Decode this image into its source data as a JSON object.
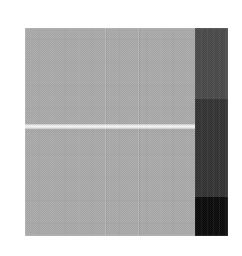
{
  "canvas": {
    "width": 242,
    "height": 256,
    "background": "#ffffff",
    "description": "Grayscale image panel with large flat gray field, one light horizontal stripe, and a right-hand vertical column of three darker tonal bands"
  },
  "image_block": {
    "label": "grayscale panel",
    "x": 25,
    "y": 28,
    "width": 203,
    "height": 208,
    "base_color": "#ababab"
  },
  "regions": {
    "gray_field": {
      "label": "flat gray field",
      "x": 0,
      "y": 0,
      "width": 170,
      "height": 208,
      "color": "#ababab",
      "texture": "fine dither noise with faint vertical and horizontal seams"
    },
    "light_stripe": {
      "label": "light horizontal stripe",
      "x": 0,
      "y": 96,
      "width": 170,
      "height": 5,
      "color": "#dcdcdc"
    },
    "seams": [
      {
        "label": "vertical seam light",
        "x": 80,
        "color": "#bdbdbd"
      },
      {
        "label": "vertical seam dark",
        "x": 81,
        "color": "#a2a2a2"
      },
      {
        "label": "vertical seam light",
        "x": 113,
        "color": "#b8b8b8"
      },
      {
        "label": "vertical seam dark",
        "x": 114,
        "color": "#a4a4a4"
      }
    ],
    "dark_column": {
      "label": "right tonal column",
      "x": 170,
      "y": 0,
      "width": 33,
      "height": 208,
      "bands": [
        {
          "label": "upper dark gray band",
          "y": 0,
          "height": 71,
          "color": "#4a4a4a"
        },
        {
          "label": "middle darker gray band",
          "y": 71,
          "height": 98,
          "color": "#333333"
        },
        {
          "label": "lower near-black band",
          "y": 169,
          "height": 39,
          "color": "#0a0a0a"
        }
      ]
    }
  }
}
